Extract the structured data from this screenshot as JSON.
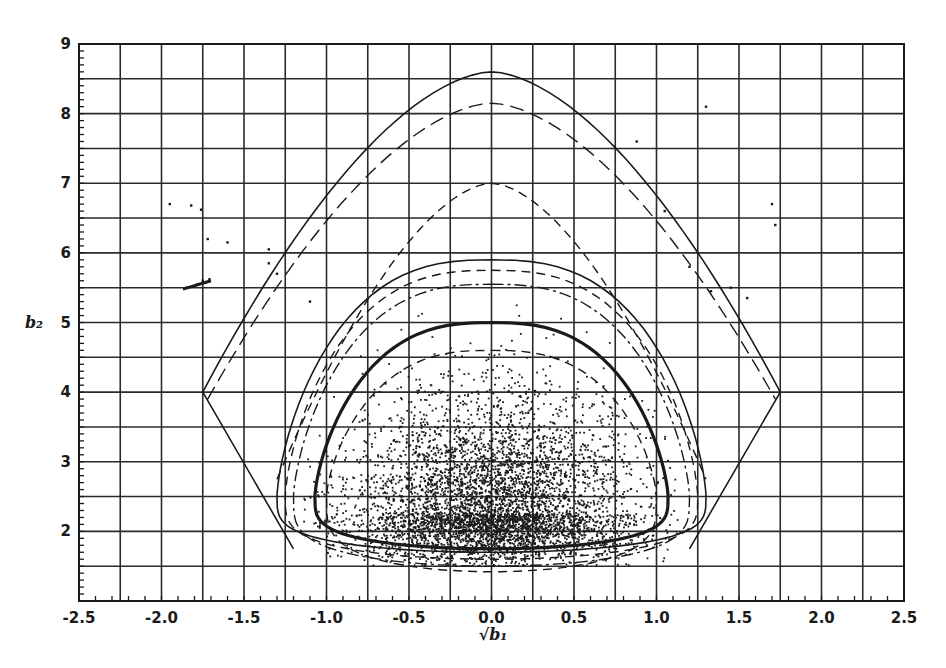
{
  "chart_data": {
    "type": "scatter",
    "title": "",
    "xlabel": "√b₁",
    "ylabel": "b₂",
    "xlim": [
      -2.5,
      2.5
    ],
    "ylim": [
      1,
      9
    ],
    "grid": true,
    "grid_spacing": {
      "x": 0.25,
      "y": 0.5
    },
    "x_ticks": [
      "-2.5",
      "-2.0",
      "-1.5",
      "-1.0",
      "-0.5",
      "0.0",
      "0.5",
      "1.0",
      "1.5",
      "2.0",
      "2.5"
    ],
    "x_tick_values": [
      -2.5,
      -2.0,
      -1.5,
      -1.0,
      -0.5,
      0.0,
      0.5,
      1.0,
      1.5,
      2.0,
      2.5
    ],
    "y_ticks": [
      "2",
      "3",
      "4",
      "5",
      "6",
      "7",
      "8",
      "9"
    ],
    "y_tick_values": [
      2,
      3,
      4,
      5,
      6,
      7,
      8,
      9
    ],
    "curves": [
      {
        "name": "outer-solid-boundary",
        "style": "solid",
        "width": 1.6,
        "top": 8.6,
        "corner_x": 1.75,
        "corner_y": 4.0,
        "bottom": 1.75,
        "bottom_halfwidth": 1.2,
        "shape": "wedge"
      },
      {
        "name": "outer-long-dash",
        "style": "longdash",
        "width": 1.4,
        "top": 8.15,
        "corner_x": 1.72,
        "corner_y": 3.9,
        "bottom": 2.3,
        "bottom_halfwidth": 1.3,
        "shape": "open"
      },
      {
        "name": "outer-short-dash",
        "style": "dash",
        "width": 1.4,
        "top": 7.0,
        "corner_x": 1.3,
        "corner_y": 2.75,
        "bottom": 2.6,
        "bottom_halfwidth": 1.2,
        "shape": "open"
      },
      {
        "name": "middle-solid",
        "style": "solid",
        "width": 1.6,
        "top": 5.9,
        "halfwidth": 1.3,
        "bottom": 1.7,
        "shape": "loop"
      },
      {
        "name": "middle-dash",
        "style": "dash",
        "width": 1.4,
        "top": 5.75,
        "halfwidth": 1.25,
        "bottom": 1.6,
        "shape": "loop"
      },
      {
        "name": "middle-dashdot",
        "style": "dashdot",
        "width": 1.4,
        "top": 5.55,
        "halfwidth": 1.2,
        "bottom": 1.5,
        "shape": "loop"
      },
      {
        "name": "inner-bold-solid",
        "style": "solid",
        "width": 3.2,
        "top": 5.0,
        "halfwidth": 1.07,
        "bottom": 1.75,
        "shape": "loop"
      },
      {
        "name": "lowest-dash",
        "style": "dash",
        "width": 1.4,
        "top": 4.6,
        "halfwidth": 1.0,
        "bottom": 1.42,
        "shape": "loop"
      }
    ],
    "scatter": {
      "n_points": 5200,
      "center_x": 0.0,
      "center_y": 2.25,
      "spread_x": 0.42,
      "spread_y_up": 0.85,
      "spread_y_down": 0.35,
      "seed": 7,
      "extra_points": [
        [
          -1.85,
          5.5
        ],
        [
          -1.78,
          5.55
        ],
        [
          -1.75,
          5.6
        ],
        [
          -1.71,
          5.62
        ],
        [
          -1.95,
          6.7
        ],
        [
          -1.82,
          6.68
        ],
        [
          -1.76,
          6.62
        ],
        [
          -1.72,
          6.2
        ],
        [
          -1.6,
          6.15
        ],
        [
          -1.35,
          6.05
        ],
        [
          -1.35,
          5.85
        ],
        [
          -1.3,
          5.7
        ],
        [
          1.33,
          5.45
        ],
        [
          1.2,
          5.8
        ],
        [
          1.45,
          5.5
        ],
        [
          1.55,
          5.35
        ],
        [
          1.72,
          6.4
        ],
        [
          1.7,
          6.7
        ],
        [
          0.88,
          7.6
        ],
        [
          1.3,
          8.1
        ],
        [
          -1.1,
          5.3
        ],
        [
          1.05,
          6.6
        ]
      ]
    },
    "colors": {
      "ink": "#1a1a1a",
      "grid": "#2a2a2a",
      "background": "#ffffff"
    }
  }
}
